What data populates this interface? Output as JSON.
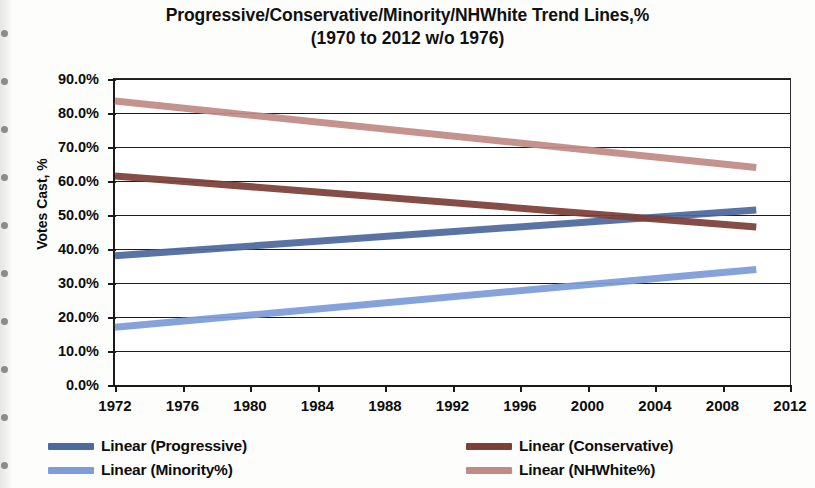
{
  "chart_data": {
    "type": "line",
    "title": "Progressive/Conservative/Minority/NHWhite  Trend Lines,%",
    "subtitle": "(1970 to 2012 w/o 1976)",
    "xlabel": "",
    "ylabel": "Votes Cast, %",
    "xlim": [
      1972,
      2012
    ],
    "ylim": [
      0,
      90
    ],
    "xticks": [
      "1972",
      "1976",
      "1980",
      "1984",
      "1988",
      "1992",
      "1996",
      "2000",
      "2004",
      "2008",
      "2012"
    ],
    "xtick_values": [
      1972,
      1976,
      1980,
      1984,
      1988,
      1992,
      1996,
      2000,
      2004,
      2008,
      2012
    ],
    "yticks": [
      "0.0%",
      "10.0%",
      "20.0%",
      "30.0%",
      "40.0%",
      "50.0%",
      "60.0%",
      "70.0%",
      "80.0%",
      "90.0%"
    ],
    "ytick_values": [
      0,
      10,
      20,
      30,
      40,
      50,
      60,
      70,
      80,
      90
    ],
    "grid": "horizontal",
    "legend_position": "bottom",
    "series": [
      {
        "name": "Linear (Progressive)",
        "color": "#4d6a9e",
        "x": [
          1972,
          2010
        ],
        "values": [
          38.0,
          51.5
        ]
      },
      {
        "name": "Linear (Conservative)",
        "color": "#7c4038",
        "x": [
          1972,
          2010
        ],
        "values": [
          61.5,
          46.5
        ]
      },
      {
        "name": "Linear (Minority%)",
        "color": "#7d9cd8",
        "x": [
          1972,
          2010
        ],
        "values": [
          17.0,
          34.0
        ]
      },
      {
        "name": "Linear (NHWhite%)",
        "color": "#c08b86",
        "x": [
          1972,
          2010
        ],
        "values": [
          83.5,
          64.0
        ]
      }
    ]
  },
  "legend": {
    "items": [
      {
        "label": "Linear (Progressive)",
        "color": "#4d6a9e"
      },
      {
        "label": "Linear (Conservative)",
        "color": "#7c4038"
      },
      {
        "label": "Linear (Minority%)",
        "color": "#7d9cd8"
      },
      {
        "label": "Linear (NHWhite%)",
        "color": "#c08b86"
      }
    ]
  }
}
